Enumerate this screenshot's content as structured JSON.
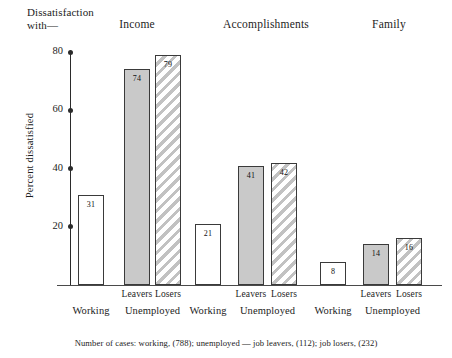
{
  "figure": {
    "title_line1": "Dissatisfaction",
    "title_line2": "with—",
    "footnote": "Number of cases: working, (788); unemployed — job leavers, (112); job losers, (232)"
  },
  "chart_data": {
    "type": "bar",
    "title": "Dissatisfaction with—",
    "xlabel": "",
    "ylabel": "Percent dissatisfied",
    "ylim": [
      0,
      80
    ],
    "yticks": [
      20,
      40,
      60,
      80
    ],
    "ytick_labels": [
      "20",
      "40",
      "60",
      "80"
    ],
    "grid": false,
    "legend": "none",
    "groups": [
      "Income",
      "Accomplishments",
      "Family"
    ],
    "categories": [
      "Working",
      "Leavers",
      "Losers"
    ],
    "category_supergroups": [
      "",
      "Unemployed",
      "Unemployed"
    ],
    "series": [
      {
        "name": "Working",
        "fill": "open",
        "values": [
          31,
          21,
          8
        ]
      },
      {
        "name": "Leavers",
        "fill": "solid",
        "values": [
          74,
          41,
          14
        ]
      },
      {
        "name": "Losers",
        "fill": "hatch",
        "values": [
          79,
          42,
          16
        ]
      }
    ],
    "annotations": [
      "Number of cases: working, (788); unemployed — job leavers, (112); job losers, (232)"
    ]
  },
  "axis": {
    "y_title": "Percent dissatisfied",
    "ticks": [
      {
        "label": "80",
        "value": 80
      },
      {
        "label": "60",
        "value": 60
      },
      {
        "label": "40",
        "value": 40
      },
      {
        "label": "20",
        "value": 20
      }
    ]
  },
  "groups": [
    {
      "name": "Income",
      "bars": [
        {
          "label": "Working",
          "supergroup": "",
          "value": 31,
          "value_label": "31",
          "fill": "open"
        },
        {
          "label": "Leavers",
          "supergroup": "Unemployed",
          "value": 74,
          "value_label": "74",
          "fill": "solid"
        },
        {
          "label": "Losers",
          "supergroup": "Unemployed",
          "value": 79,
          "value_label": "79",
          "fill": "hatch"
        }
      ]
    },
    {
      "name": "Accomplishments",
      "bars": [
        {
          "label": "Working",
          "supergroup": "",
          "value": 21,
          "value_label": "21",
          "fill": "open"
        },
        {
          "label": "Leavers",
          "supergroup": "Unemployed",
          "value": 41,
          "value_label": "41",
          "fill": "solid"
        },
        {
          "label": "Losers",
          "supergroup": "Unemployed",
          "value": 42,
          "value_label": "42",
          "fill": "hatch"
        }
      ]
    },
    {
      "name": "Family",
      "bars": [
        {
          "label": "Working",
          "supergroup": "",
          "value": 8,
          "value_label": "8",
          "fill": "open"
        },
        {
          "label": "Leavers",
          "supergroup": "Unemployed",
          "value": 14,
          "value_label": "14",
          "fill": "solid"
        },
        {
          "label": "Losers",
          "supergroup": "Unemployed",
          "value": 16,
          "value_label": "16",
          "fill": "hatch"
        }
      ]
    }
  ],
  "xlabels": {
    "working": "Working",
    "unemployed": "Unemployed",
    "leavers": "Leavers",
    "losers": "Losers"
  }
}
